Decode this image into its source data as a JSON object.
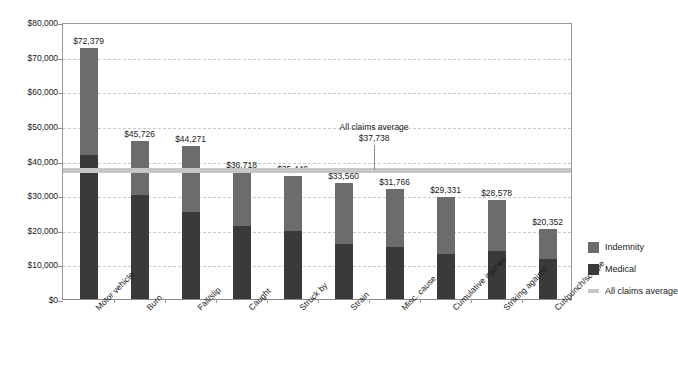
{
  "chart_data": {
    "type": "bar",
    "subtype": "stacked-vertical",
    "title": "",
    "xlabel": "",
    "ylabel": "",
    "ylim": [
      0,
      80000
    ],
    "ytick_interval": 10000,
    "ytick_labels": [
      "$80,000",
      "$70,000",
      "$60,000",
      "$50,000",
      "$40,000",
      "$30,000",
      "$20,000",
      "$10,000",
      "$0"
    ],
    "ytick_values": [
      80000,
      70000,
      60000,
      50000,
      40000,
      30000,
      20000,
      10000,
      0
    ],
    "grid": true,
    "grid_axis": "y",
    "grid_style": "dashed",
    "legend_position": "right",
    "categories": [
      "Motor vehicle",
      "Burn",
      "Fall/slip",
      "Caught",
      "Struck by",
      "Strain",
      "Misc. cause",
      "Cumulative injuries",
      "Striking against",
      "Cut/punch/scrape"
    ],
    "series": [
      {
        "name": "Medical",
        "color": "#3a3a3a",
        "values": [
          41500,
          30000,
          25000,
          21000,
          19500,
          16000,
          15000,
          13000,
          14000,
          11500
        ]
      },
      {
        "name": "Indemnity",
        "color": "#6c6c6c",
        "values": [
          30879,
          15726,
          19271,
          15718,
          15949,
          17560,
          16766,
          16331,
          14578,
          8852
        ]
      }
    ],
    "totals": [
      72379,
      45726,
      44271,
      36718,
      35449,
      33560,
      31766,
      29331,
      28578,
      20352
    ],
    "total_labels": [
      "$72,379",
      "$45,726",
      "$44,271",
      "$36,718",
      "$35,449",
      "$33,560",
      "$31,766",
      "$29,331",
      "$28,578",
      "$20,352"
    ],
    "reference_line": {
      "label": "All claims average",
      "value": 37738,
      "value_label": "$37,738",
      "color": "#c6c6c6"
    },
    "legend_entries": [
      {
        "label": "Indemnity",
        "color": "#6c6c6c",
        "marker": "square"
      },
      {
        "label": "Medical",
        "color": "#3a3a3a",
        "marker": "square"
      },
      {
        "label": "All claims average",
        "color": "#c6c6c6",
        "marker": "line"
      }
    ]
  },
  "colors": {
    "indemnity": "#6c6c6c",
    "medical": "#3a3a3a",
    "average_line": "#c6c6c6",
    "gridline": "#c9c9c9",
    "axis": "#9a9a9a",
    "background": "#ffffff",
    "text": "#1a1a1a"
  }
}
